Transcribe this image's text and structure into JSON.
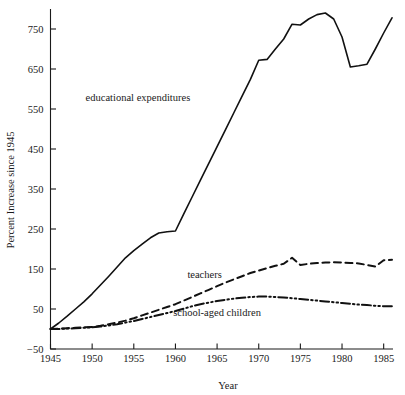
{
  "chart_data": {
    "type": "line",
    "title": "",
    "xlabel": "Year",
    "ylabel": "Percent Increase since 1945",
    "xlim": [
      1945,
      1986
    ],
    "ylim": [
      -50,
      800
    ],
    "grid": false,
    "legend_position": "inline-annotations",
    "xticks": [
      "1945",
      "1950",
      "1955",
      "1960",
      "1965",
      "1970",
      "1975",
      "1980",
      "1985"
    ],
    "xtick_values": [
      1945,
      1950,
      1955,
      1960,
      1965,
      1970,
      1975,
      1980,
      1985
    ],
    "yticks": [
      "750",
      "650",
      "550",
      "450",
      "350",
      "250",
      "150",
      "50",
      "−50"
    ],
    "ytick_values": [
      750,
      650,
      550,
      450,
      350,
      250,
      150,
      50,
      -50
    ],
    "x": [
      1945,
      1946,
      1947,
      1948,
      1949,
      1950,
      1951,
      1952,
      1953,
      1954,
      1955,
      1956,
      1957,
      1958,
      1959,
      1960,
      1961,
      1962,
      1963,
      1964,
      1965,
      1966,
      1967,
      1968,
      1969,
      1970,
      1971,
      1972,
      1973,
      1974,
      1975,
      1976,
      1977,
      1978,
      1979,
      1980,
      1981,
      1982,
      1983,
      1984,
      1985,
      1986
    ],
    "series": [
      {
        "name": "educational expenditures",
        "style": "solid",
        "label_x": 1955.5,
        "label_y": 570,
        "values": [
          0,
          15,
          32,
          50,
          68,
          88,
          110,
          132,
          155,
          178,
          196,
          212,
          228,
          240,
          243,
          245,
          288,
          330,
          372,
          414,
          456,
          498,
          540,
          582,
          624,
          672,
          674,
          700,
          725,
          762,
          760,
          775,
          786,
          790,
          775,
          730,
          655,
          658,
          662,
          700,
          740,
          778
        ]
      },
      {
        "name": "teachers",
        "style": "dashed",
        "label_x": 1963.5,
        "label_y": 128,
        "values": [
          0,
          1,
          2,
          3,
          4,
          5,
          8,
          12,
          16,
          21,
          27,
          34,
          41,
          48,
          55,
          62,
          71,
          80,
          89,
          98,
          107,
          116,
          124,
          132,
          140,
          146,
          152,
          158,
          163,
          178,
          160,
          163,
          165,
          166,
          167,
          166,
          165,
          164,
          160,
          156,
          172,
          173
        ]
      },
      {
        "name": "school-aged children",
        "style": "dash-dot-dot",
        "label_x": 1965.0,
        "label_y": 33,
        "values": [
          0,
          0,
          1,
          2,
          3,
          4,
          6,
          9,
          12,
          16,
          20,
          25,
          30,
          35,
          40,
          45,
          51,
          57,
          62,
          66,
          70,
          73,
          76,
          78,
          80,
          81,
          81,
          80,
          79,
          77,
          75,
          73,
          71,
          69,
          67,
          65,
          63,
          61,
          60,
          58,
          57,
          57
        ]
      }
    ]
  },
  "axis": {
    "x_title": "Year",
    "y_title": "Percent Increase since 1945"
  }
}
